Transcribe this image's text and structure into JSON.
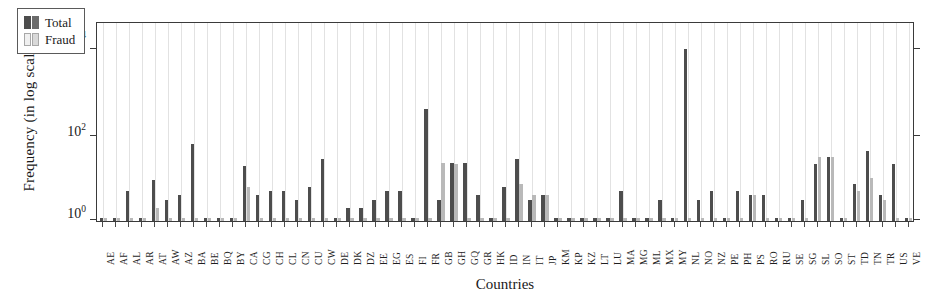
{
  "chart_data": {
    "type": "bar",
    "title": "",
    "xlabel": "Countries",
    "ylabel": "Frequency (in log scale)",
    "yscale": "log",
    "ylim": [
      1,
      40000
    ],
    "ytick_values": [
      1,
      100,
      10000
    ],
    "ytick_labels": [
      "10⁰",
      "10²",
      "10⁴"
    ],
    "grid": "vertical",
    "legend_position": "upper left",
    "categories": [
      "AE",
      "AF",
      "AL",
      "AR",
      "AT",
      "AW",
      "AZ",
      "BA",
      "BE",
      "BQ",
      "BY",
      "CA",
      "CG",
      "CH",
      "CL",
      "CN",
      "CU",
      "CW",
      "DE",
      "DK",
      "DZ",
      "EE",
      "EG",
      "ES",
      "FI",
      "FR",
      "GB",
      "GH",
      "GQ",
      "GR",
      "HK",
      "ID",
      "IN",
      "IT",
      "JP",
      "KM",
      "KP",
      "KZ",
      "LT",
      "LU",
      "MA",
      "MG",
      "ML",
      "MX",
      "MY",
      "NL",
      "NO",
      "NZ",
      "PE",
      "PH",
      "PS",
      "RO",
      "RU",
      "SE",
      "SG",
      "SL",
      "SO",
      "ST",
      "TD",
      "TN",
      "TR",
      "US",
      "VE"
    ],
    "series": [
      {
        "name": "Total",
        "color": "#4d4d4d",
        "values": [
          1,
          1,
          5,
          1,
          9,
          3,
          4,
          60,
          1,
          1,
          1,
          18,
          4,
          5,
          5,
          3,
          6,
          27,
          1,
          2,
          2,
          3,
          5,
          5,
          1,
          370,
          3,
          22,
          22,
          4,
          1,
          6,
          27,
          3,
          4,
          1,
          1,
          1,
          1,
          1,
          5,
          1,
          1,
          3,
          1,
          9000,
          3,
          5,
          1,
          5,
          4,
          4,
          1,
          1,
          3,
          20,
          30,
          1,
          7,
          40,
          4,
          21,
          1
        ]
      },
      {
        "name": "Fraud",
        "color": "#b9b9b9",
        "values": [
          1,
          1,
          1,
          1,
          2,
          1,
          1,
          1,
          1,
          1,
          1,
          6,
          1,
          1,
          1,
          1,
          1,
          1,
          1,
          1,
          1,
          1,
          1,
          1,
          1,
          1,
          22,
          20,
          1,
          1,
          1,
          1,
          7,
          4,
          4,
          1,
          1,
          1,
          1,
          1,
          1,
          1,
          1,
          1,
          1,
          1,
          1,
          1,
          1,
          1,
          4,
          1,
          1,
          1,
          1,
          30,
          30,
          1,
          5,
          10,
          3,
          1,
          1
        ]
      }
    ]
  },
  "legend": {
    "items": [
      {
        "label": "Total"
      },
      {
        "label": "Fraud"
      }
    ]
  }
}
